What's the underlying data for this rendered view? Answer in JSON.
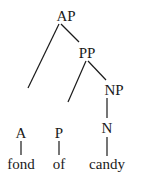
{
  "tree": {
    "type": "syntax-tree",
    "nodes": [
      {
        "id": "AP",
        "label": "AP",
        "x": 66,
        "y": 9
      },
      {
        "id": "PP",
        "label": "PP",
        "x": 87,
        "y": 46
      },
      {
        "id": "NP",
        "label": "NP",
        "x": 114,
        "y": 83
      },
      {
        "id": "A",
        "label": "A",
        "x": 21,
        "y": 126
      },
      {
        "id": "P",
        "label": "P",
        "x": 59,
        "y": 126
      },
      {
        "id": "N",
        "label": "N",
        "x": 107,
        "y": 121
      },
      {
        "id": "fond",
        "label": "fond",
        "x": 21,
        "y": 157
      },
      {
        "id": "of",
        "label": "of",
        "x": 59,
        "y": 157
      },
      {
        "id": "candy",
        "label": "candy",
        "x": 107,
        "y": 157
      }
    ],
    "edges": [
      {
        "from": "AP",
        "to": "A",
        "x1": 59,
        "y1": 24,
        "x2": 28,
        "y2": 88
      },
      {
        "from": "AP",
        "to": "PP",
        "x1": 61,
        "y1": 24,
        "x2": 79,
        "y2": 42
      },
      {
        "from": "PP",
        "to": "P",
        "x1": 86,
        "y1": 61,
        "x2": 68,
        "y2": 102
      },
      {
        "from": "PP",
        "to": "NP",
        "x1": 88,
        "y1": 61,
        "x2": 106,
        "y2": 80
      },
      {
        "from": "NP",
        "to": "N",
        "x1": 107,
        "y1": 98,
        "x2": 107,
        "y2": 118
      },
      {
        "from": "A",
        "to": "fond",
        "x1": 21,
        "y1": 141,
        "x2": 21,
        "y2": 155
      },
      {
        "from": "P",
        "to": "of",
        "x1": 59,
        "y1": 141,
        "x2": 59,
        "y2": 155
      },
      {
        "from": "N",
        "to": "candy",
        "x1": 107,
        "y1": 137,
        "x2": 107,
        "y2": 156
      }
    ]
  },
  "labels": {
    "ap": "AP",
    "pp": "PP",
    "np": "NP",
    "a": "A",
    "p": "P",
    "n": "N",
    "fond": "fond",
    "of": "of",
    "candy": "candy"
  }
}
